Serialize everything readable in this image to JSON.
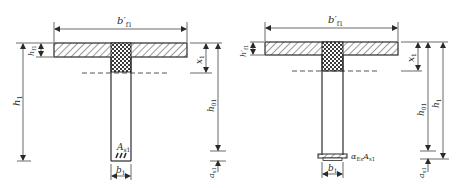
{
  "figure": {
    "colors": {
      "line": "#2a2a2a",
      "hatch": "#3a3a3a",
      "background": "#ffffff"
    }
  },
  "left_section": {
    "flange_width_label": "b′",
    "flange_width_sub": "f1",
    "flange_thickness_label": "h",
    "flange_thickness_sub": "f1",
    "total_height_label": "h",
    "total_height_sub": "1",
    "neutral_axis_depth_label": "x",
    "neutral_axis_depth_sub": "1",
    "effective_depth_label": "h",
    "effective_depth_sub": "01",
    "cover_label": "a",
    "cover_sub": "s1",
    "web_width_label": "b",
    "web_width_sub": "1",
    "steel_area_label": "A",
    "steel_area_sub": "s1"
  },
  "right_section": {
    "flange_width_label": "b′",
    "flange_width_sub": "f1",
    "flange_thickness_label": "h′",
    "flange_thickness_sub": "f1",
    "total_height_label": "h",
    "total_height_sub": "1",
    "neutral_axis_depth_label": "x",
    "neutral_axis_depth_sub": "1",
    "effective_depth_label": "h",
    "effective_depth_sub": "01",
    "cover_label": "a",
    "cover_sub": "s1",
    "web_width_label": "b",
    "web_width_sub": "1",
    "transformed_steel_label_a": "α",
    "transformed_steel_label_a_sub": "Es",
    "transformed_steel_label_b": "A",
    "transformed_steel_label_b_sub": "s1"
  }
}
